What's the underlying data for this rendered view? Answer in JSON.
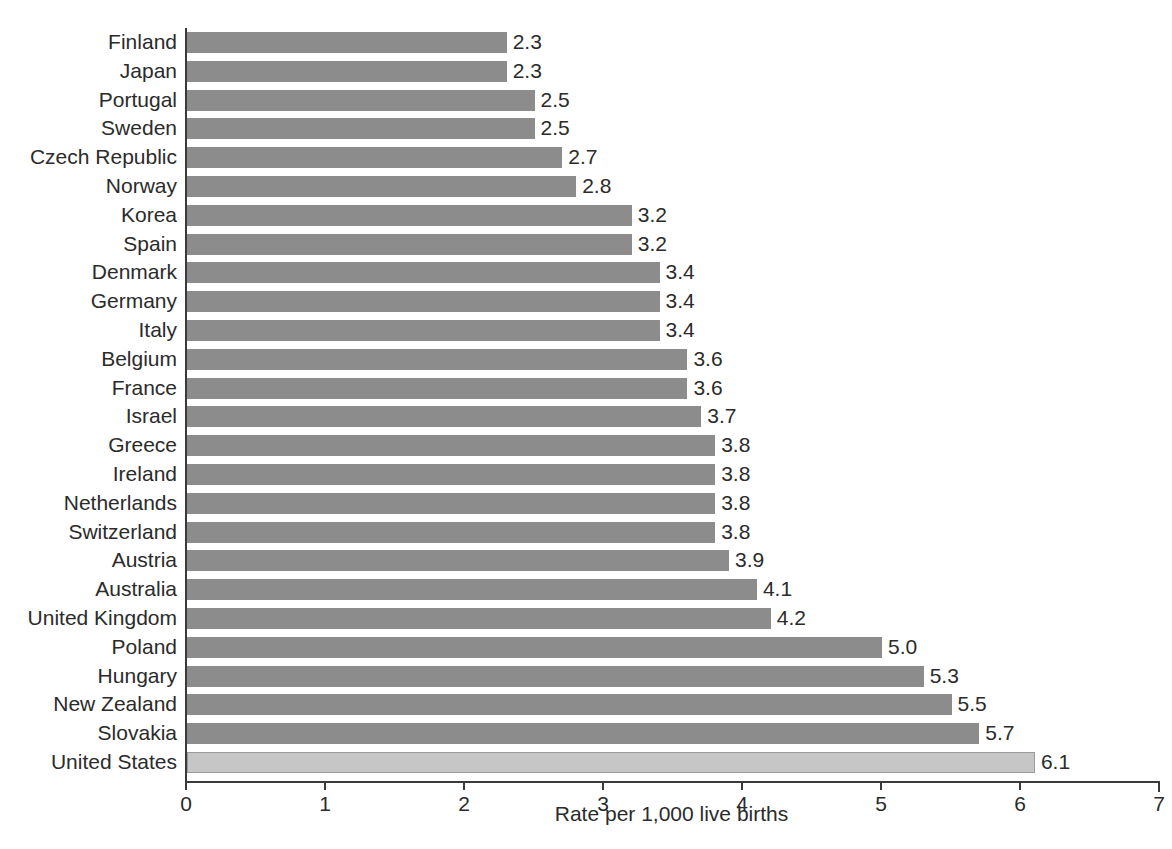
{
  "chart_data": {
    "type": "bar",
    "orientation": "horizontal",
    "title": "",
    "xlabel": "Rate per 1,000 live births",
    "ylabel": "",
    "xlim": [
      0,
      7
    ],
    "xticks": [
      "0",
      "1",
      "2",
      "3",
      "4",
      "5",
      "6",
      "7"
    ],
    "grid": false,
    "legend": null,
    "bar_color": "#8c8c8c",
    "highlight_color": "#c6c6c6",
    "highlight_category": "United States",
    "categories": [
      "Finland",
      "Japan",
      "Portugal",
      "Sweden",
      "Czech Republic",
      "Norway",
      "Korea",
      "Spain",
      "Denmark",
      "Germany",
      "Italy",
      "Belgium",
      "France",
      "Israel",
      "Greece",
      "Ireland",
      "Netherlands",
      "Switzerland",
      "Austria",
      "Australia",
      "United Kingdom",
      "Poland",
      "Hungary",
      "New Zealand",
      "Slovakia",
      "United States"
    ],
    "values": [
      2.3,
      2.3,
      2.5,
      2.5,
      2.7,
      2.8,
      3.2,
      3.2,
      3.4,
      3.4,
      3.4,
      3.6,
      3.6,
      3.7,
      3.8,
      3.8,
      3.8,
      3.8,
      3.9,
      4.1,
      4.2,
      5.0,
      5.3,
      5.5,
      5.7,
      6.1
    ],
    "value_labels": [
      "2.3",
      "2.3",
      "2.5",
      "2.5",
      "2.7",
      "2.8",
      "3.2",
      "3.2",
      "3.4",
      "3.4",
      "3.4",
      "3.6",
      "3.6",
      "3.7",
      "3.8",
      "3.8",
      "3.8",
      "3.8",
      "3.9",
      "4.1",
      "4.2",
      "5.0",
      "5.3",
      "5.5",
      "5.7",
      "6.1"
    ]
  }
}
